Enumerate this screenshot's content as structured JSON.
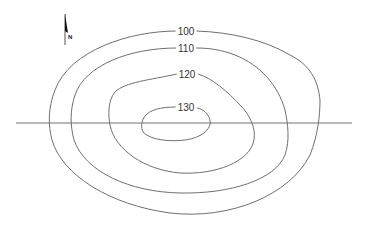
{
  "diagram": {
    "type": "topographic-contour-map",
    "north_arrow": {
      "label": "N"
    },
    "contours": [
      {
        "value": "100",
        "label": "100"
      },
      {
        "value": "110",
        "label": "110"
      },
      {
        "value": "120",
        "label": "120"
      },
      {
        "value": "130",
        "label": "130"
      }
    ],
    "profile_line": {
      "orientation": "horizontal"
    },
    "colors": {
      "line": "#6f6f6f",
      "text": "#333333",
      "background": "#ffffff"
    }
  }
}
